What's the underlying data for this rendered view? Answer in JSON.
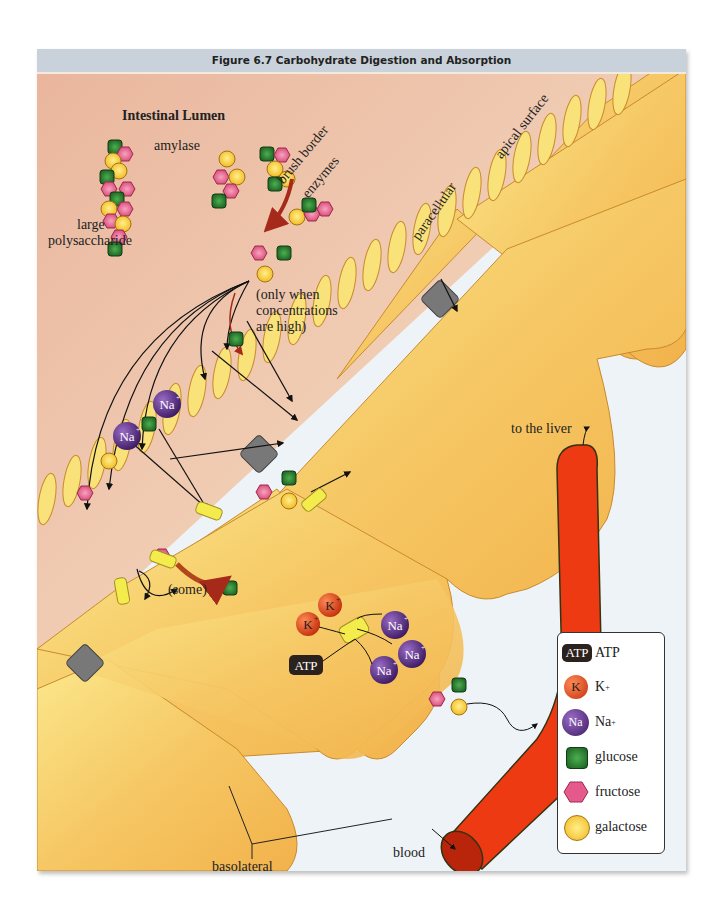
{
  "figure": {
    "title": "Figure 6.7   Carbohydrate Digestion and Absorption"
  },
  "labels": {
    "lumen": "Intestinal Lumen",
    "amylase": "amylase",
    "brush_border_1": "brush border",
    "brush_border_2": "enzymes",
    "large_1": "large",
    "large_2": "polysaccharide",
    "only_when_1": "(only when",
    "only_when_2": "concentrations",
    "only_when_3": "are high)",
    "paracellular": "paracellular",
    "apical": "apical surface",
    "to_liver": "to the liver",
    "some": "(some)",
    "atp": "ATP",
    "k": "K",
    "na": "Na",
    "blood": "blood",
    "basolateral_1": "basolateral",
    "basolateral_2": "surface"
  },
  "legend": {
    "items": [
      {
        "key": "atp",
        "label": "ATP"
      },
      {
        "key": "k",
        "label": "K",
        "sup": "+"
      },
      {
        "key": "na",
        "label": "Na",
        "sup": "+"
      },
      {
        "key": "glucose",
        "label": "glucose"
      },
      {
        "key": "fructose",
        "label": "fructose"
      },
      {
        "key": "galactose",
        "label": "galactose"
      }
    ]
  },
  "colors": {
    "lumen_bg": "#edc3aa",
    "cell": "#f5c463",
    "cell_edge": "#c98a2d",
    "blood_vessel": "#ee3a12",
    "glucose": "#2e7d32",
    "fructose": "#e55a8a",
    "galactose": "#f8c72e",
    "sodium": "#5b2a86",
    "potassium": "#e8501f",
    "transporter": "#f3ec4c",
    "channel": "#7a7a7a",
    "interstitial": "#eef3f8"
  }
}
